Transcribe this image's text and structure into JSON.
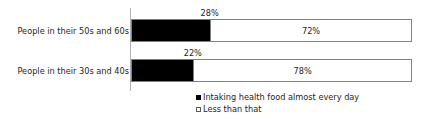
{
  "chart_data": {
    "type": "bar",
    "orientation": "horizontal",
    "stacked": true,
    "stack_mode": "percent",
    "title": "",
    "subtitle": "",
    "xlabel": "",
    "ylabel": "",
    "xlim": [
      0,
      100
    ],
    "grid": false,
    "legend_position": "bottom",
    "categories": [
      "People in their 50s and 60s",
      "People in their 30s and 40s"
    ],
    "series": [
      {
        "name": "Intaking health food almost every day",
        "color": "#000000",
        "values": [
          28,
          22
        ],
        "value_labels": [
          "28%",
          "22%"
        ],
        "label_position": "outside-above"
      },
      {
        "name": "Less than that",
        "color": "#ffffff",
        "values": [
          72,
          78
        ],
        "value_labels": [
          "72%",
          "78%"
        ],
        "label_position": "inside-center"
      }
    ]
  },
  "legend": {
    "items": [
      {
        "label": "Intaking health food almost every day",
        "marker": "filled-square-icon"
      },
      {
        "label": "Less than that",
        "marker": "hollow-square-icon"
      }
    ]
  },
  "axis": {
    "line_color": "#b3b3b3"
  }
}
